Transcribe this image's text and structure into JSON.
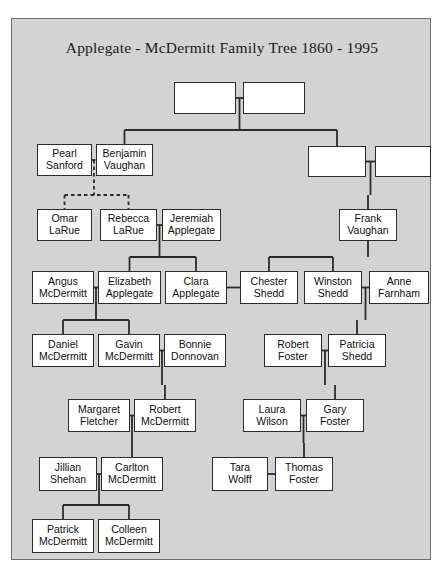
{
  "document": {
    "title": "Applegate - McDermitt Family Tree 1860 - 1995",
    "background_color": "#d3d3d3",
    "box_fill_color": "#ffffff",
    "line_color": "#2b2b2b"
  },
  "chart_data": {
    "type": "diagram",
    "diagram_type": "family-tree",
    "title": "Applegate - McDermitt Family Tree 1860 - 1995",
    "generations": 8,
    "nodes": [
      {
        "id": "n1",
        "first": "",
        "last": "",
        "blank": true,
        "x": 162,
        "y": 63,
        "w": 62,
        "h": 32
      },
      {
        "id": "n2",
        "first": "",
        "last": "",
        "blank": true,
        "x": 231,
        "y": 63,
        "w": 62,
        "h": 32
      },
      {
        "id": "n3",
        "first": "Pearl",
        "last": "Sanford",
        "blank": false,
        "x": 25,
        "y": 125,
        "w": 55,
        "h": 32
      },
      {
        "id": "n4",
        "first": "Benjamin",
        "last": "Vaughan",
        "blank": false,
        "x": 84,
        "y": 125,
        "w": 57,
        "h": 32
      },
      {
        "id": "n5",
        "first": "",
        "last": "",
        "blank": true,
        "x": 296,
        "y": 127,
        "w": 58,
        "h": 31
      },
      {
        "id": "n6",
        "first": "",
        "last": "",
        "blank": true,
        "x": 363,
        "y": 127,
        "w": 56,
        "h": 31
      },
      {
        "id": "n7",
        "first": "Omar",
        "last": "LaRue",
        "blank": false,
        "x": 25,
        "y": 190,
        "w": 55,
        "h": 32
      },
      {
        "id": "n8",
        "first": "Rebecca",
        "last": "LaRue",
        "blank": false,
        "x": 88,
        "y": 190,
        "w": 57,
        "h": 32
      },
      {
        "id": "n9",
        "first": "Jeremiah",
        "last": "Applegate",
        "blank": false,
        "x": 150,
        "y": 190,
        "w": 59,
        "h": 32
      },
      {
        "id": "n10",
        "first": "Frank",
        "last": "Vaughan",
        "blank": false,
        "x": 327,
        "y": 190,
        "w": 58,
        "h": 32
      },
      {
        "id": "n11",
        "first": "Angus",
        "last": "McDermitt",
        "blank": false,
        "x": 20,
        "y": 252,
        "w": 62,
        "h": 33
      },
      {
        "id": "n12",
        "first": "Elizabeth",
        "last": "Applegate",
        "blank": false,
        "x": 86,
        "y": 252,
        "w": 63,
        "h": 33
      },
      {
        "id": "n13",
        "first": "Clara",
        "last": "Applegate",
        "blank": false,
        "x": 153,
        "y": 252,
        "w": 62,
        "h": 33
      },
      {
        "id": "n14",
        "first": "Chester",
        "last": "Shedd",
        "blank": false,
        "x": 228,
        "y": 252,
        "w": 58,
        "h": 33
      },
      {
        "id": "n15",
        "first": "Winston",
        "last": "Shedd",
        "blank": false,
        "x": 292,
        "y": 252,
        "w": 58,
        "h": 33
      },
      {
        "id": "n16",
        "first": "Anne",
        "last": "Farnham",
        "blank": false,
        "x": 357,
        "y": 252,
        "w": 60,
        "h": 33
      },
      {
        "id": "n17",
        "first": "Daniel",
        "last": "McDermitt",
        "blank": false,
        "x": 20,
        "y": 315,
        "w": 62,
        "h": 33
      },
      {
        "id": "n18",
        "first": "Gavin",
        "last": "McDermitt",
        "blank": false,
        "x": 86,
        "y": 315,
        "w": 62,
        "h": 33
      },
      {
        "id": "n19",
        "first": "Bonnie",
        "last": "Donnovan",
        "blank": false,
        "x": 152,
        "y": 315,
        "w": 62,
        "h": 33
      },
      {
        "id": "n20",
        "first": "Robert",
        "last": "Foster",
        "blank": false,
        "x": 252,
        "y": 315,
        "w": 58,
        "h": 33
      },
      {
        "id": "n21",
        "first": "Patricia",
        "last": "Shedd",
        "blank": false,
        "x": 316,
        "y": 315,
        "w": 58,
        "h": 33
      },
      {
        "id": "n22",
        "first": "Margaret",
        "last": "Fletcher",
        "blank": false,
        "x": 56,
        "y": 380,
        "w": 62,
        "h": 33
      },
      {
        "id": "n23",
        "first": "Robert",
        "last": "McDermitt",
        "blank": false,
        "x": 122,
        "y": 380,
        "w": 62,
        "h": 33
      },
      {
        "id": "n24",
        "first": "Laura",
        "last": "Wilson",
        "blank": false,
        "x": 231,
        "y": 380,
        "w": 58,
        "h": 33
      },
      {
        "id": "n25",
        "first": "Gary",
        "last": "Foster",
        "blank": false,
        "x": 294,
        "y": 380,
        "w": 58,
        "h": 33
      },
      {
        "id": "n26",
        "first": "Jillian",
        "last": "Shehan",
        "blank": false,
        "x": 27,
        "y": 438,
        "w": 58,
        "h": 34
      },
      {
        "id": "n27",
        "first": "Carlton",
        "last": "McDermitt",
        "blank": false,
        "x": 89,
        "y": 438,
        "w": 62,
        "h": 34
      },
      {
        "id": "n28",
        "first": "Tara",
        "last": "Wolff",
        "blank": false,
        "x": 200,
        "y": 438,
        "w": 56,
        "h": 34
      },
      {
        "id": "n29",
        "first": "Thomas",
        "last": "Foster",
        "blank": false,
        "x": 263,
        "y": 438,
        "w": 58,
        "h": 34
      },
      {
        "id": "n30",
        "first": "Patrick",
        "last": "McDermitt",
        "blank": false,
        "x": 20,
        "y": 500,
        "w": 62,
        "h": 34
      },
      {
        "id": "n31",
        "first": "Colleen",
        "last": "McDermitt",
        "blank": false,
        "x": 86,
        "y": 500,
        "w": 62,
        "h": 34
      }
    ],
    "marriages": [
      {
        "spouses": [
          "n1",
          "n2"
        ],
        "style": "solid"
      },
      {
        "spouses": [
          "n3",
          "n4"
        ],
        "style": "dashed"
      },
      {
        "spouses": [
          "n5",
          "n6"
        ],
        "style": "solid"
      },
      {
        "spouses": [
          "n8",
          "n9"
        ],
        "style": "solid"
      },
      {
        "spouses": [
          "n11",
          "n12"
        ],
        "style": "solid"
      },
      {
        "spouses": [
          "n13",
          "n14"
        ],
        "style": "solid"
      },
      {
        "spouses": [
          "n15",
          "n16"
        ],
        "style": "solid"
      },
      {
        "spouses": [
          "n18",
          "n19"
        ],
        "style": "solid"
      },
      {
        "spouses": [
          "n20",
          "n21"
        ],
        "style": "solid"
      },
      {
        "spouses": [
          "n22",
          "n23"
        ],
        "style": "solid"
      },
      {
        "spouses": [
          "n24",
          "n25"
        ],
        "style": "solid"
      },
      {
        "spouses": [
          "n26",
          "n27"
        ],
        "style": "solid"
      },
      {
        "spouses": [
          "n28",
          "n29"
        ],
        "style": "solid"
      }
    ],
    "descents": [
      {
        "from": [
          "n1",
          "n2"
        ],
        "children": [
          "n4",
          "n5"
        ],
        "style": "solid"
      },
      {
        "from": [
          "n3",
          "n4"
        ],
        "children": [
          "n7",
          "n8"
        ],
        "style": "dashed"
      },
      {
        "from": [
          "n5",
          "n6"
        ],
        "children": [
          "n10"
        ],
        "style": "solid"
      },
      {
        "from": [
          "n8",
          "n9"
        ],
        "children": [
          "n12",
          "n13"
        ],
        "style": "solid"
      },
      {
        "from": [
          "n10"
        ],
        "children": [
          "n14",
          "n15"
        ],
        "style": "solid"
      },
      {
        "from": [
          "n11",
          "n12"
        ],
        "children": [
          "n17",
          "n18"
        ],
        "style": "solid"
      },
      {
        "from": [
          "n15",
          "n16"
        ],
        "children": [
          "n21"
        ],
        "style": "solid"
      },
      {
        "from": [
          "n18",
          "n19"
        ],
        "children": [
          "n23"
        ],
        "style": "solid"
      },
      {
        "from": [
          "n20",
          "n21"
        ],
        "children": [
          "n25"
        ],
        "style": "solid"
      },
      {
        "from": [
          "n22",
          "n23"
        ],
        "children": [
          "n27"
        ],
        "style": "solid"
      },
      {
        "from": [
          "n24",
          "n25"
        ],
        "children": [
          "n29"
        ],
        "style": "solid"
      },
      {
        "from": [
          "n26",
          "n27"
        ],
        "children": [
          "n30",
          "n31"
        ],
        "style": "solid"
      }
    ]
  }
}
